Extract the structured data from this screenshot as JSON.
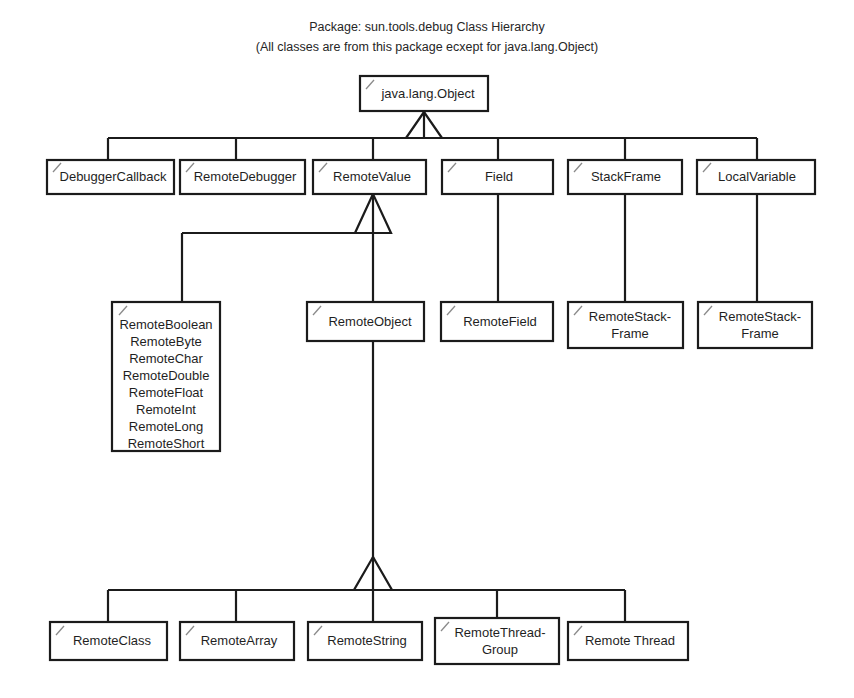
{
  "diagram": {
    "title_line_1": "Package: sun.tools.debug Class Hierarchy",
    "title_line_2": "(All classes are from this package ecxept for java.lang.Object)",
    "background_color": "#ffffff",
    "line_color": "#1b1b1b",
    "text_color": "#1f1f1f",
    "tick_color": "#8a8a8a",
    "root": {
      "label": "java.lang.Object"
    },
    "level2": [
      {
        "label": "DebuggerCallback"
      },
      {
        "label": "RemoteDebugger"
      },
      {
        "label": "RemoteValue"
      },
      {
        "label": "Field"
      },
      {
        "label": "StackFrame"
      },
      {
        "label": "LocalVariable"
      }
    ],
    "level3": [
      {
        "label": "RemoteBoolean RemoteByte RemoteChar RemoteDouble RemoteFloat RemoteInt RemoteLong RemoteShort",
        "lines": [
          "RemoteBoolean",
          "RemoteByte",
          "RemoteChar",
          "RemoteDouble",
          "RemoteFloat",
          "RemoteInt",
          "RemoteLong",
          "RemoteShort"
        ],
        "parent": "RemoteValue"
      },
      {
        "label": "RemoteObject",
        "lines": [
          "RemoteObject"
        ],
        "parent": "RemoteValue"
      },
      {
        "label": "RemoteField",
        "lines": [
          "RemoteField"
        ],
        "parent": "Field"
      },
      {
        "label": "RemoteStack-Frame",
        "lines": [
          "RemoteStack-",
          "Frame"
        ],
        "parent": "StackFrame"
      },
      {
        "label": "RemoteStack-Frame",
        "lines": [
          "RemoteStack-",
          "Frame"
        ],
        "parent": "LocalVariable"
      }
    ],
    "level4": [
      {
        "label": "RemoteClass",
        "lines": [
          "RemoteClass"
        ],
        "parent": "RemoteObject"
      },
      {
        "label": "RemoteArray",
        "lines": [
          "RemoteArray"
        ],
        "parent": "RemoteObject"
      },
      {
        "label": "RemoteString",
        "lines": [
          "RemoteString"
        ],
        "parent": "RemoteObject"
      },
      {
        "label": "RemoteThread-Group",
        "lines": [
          "RemoteThread-",
          "Group"
        ],
        "parent": "RemoteObject"
      },
      {
        "label": "Remote Thread",
        "lines": [
          "Remote Thread"
        ],
        "parent": "RemoteObject"
      }
    ],
    "generalization_markers": [
      {
        "from": "java.lang.Object",
        "note": "hollow-triangle"
      },
      {
        "from": "RemoteValue",
        "note": "hollow-triangle"
      },
      {
        "from": "RemoteObject",
        "note": "hollow-triangle"
      }
    ]
  }
}
